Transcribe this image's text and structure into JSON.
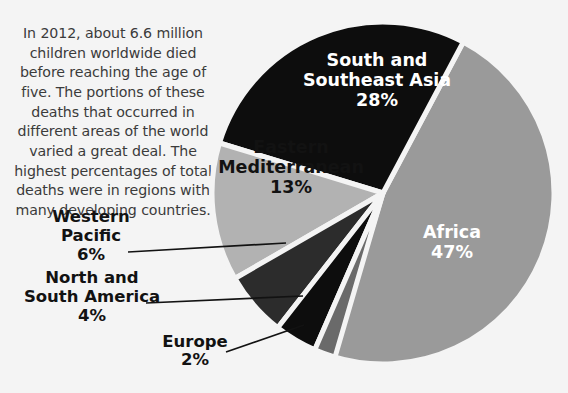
{
  "page": {
    "background_color": "#f4f4f4",
    "intro_paragraph": "In 2012, about 6.6 million children worldwide died before reaching the age of five. The portions of these deaths that occurred in different areas of the world varied a great deal. The highest percentages of total deaths were in regions with many developing countries."
  },
  "chart_data": {
    "type": "pie",
    "title": "",
    "subtitle": "",
    "xlabel": "",
    "ylabel": "",
    "units": "percent of total under-five deaths",
    "total_label": "6.6 million",
    "year": "2012",
    "legend_position": "none",
    "grid": false,
    "categories": [
      "Africa",
      "South and Southeast Asia",
      "Eastern Mediterranean",
      "Western Pacific",
      "North and South America",
      "Europe"
    ],
    "values": [
      47,
      28,
      13,
      6,
      4,
      2
    ],
    "slices": [
      {
        "name": "Africa",
        "label_line1": "Africa",
        "label_line2": "47%",
        "value": 47,
        "percent_text": "47%",
        "color": "#9a9a9a",
        "text_color": "#ffffff",
        "label_placement": "inside",
        "label_x": 452,
        "label_y": 243,
        "start_angle": -62,
        "end_angle": 107.2
      },
      {
        "name": "South and Southeast Asia",
        "label_line1": "South and",
        "label_line2": "Southeast Asia",
        "label_line3": "28%",
        "value": 28,
        "percent_text": "28%",
        "color": "#0d0d0d",
        "text_color": "#ffffff",
        "label_placement": "inside",
        "label_x": 377,
        "label_y": 81,
        "start_angle": -163,
        "end_angle": -62
      },
      {
        "name": "Eastern Mediterranean",
        "label_line1": "Eastern",
        "label_line2": "Mediterranean",
        "label_line3": "13%",
        "value": 13,
        "percent_text": "13%",
        "color": "#b2b2b2",
        "text_color": "#121212",
        "label_placement": "inside",
        "label_x": 291,
        "label_y": 168,
        "start_angle": -210,
        "end_angle": -163
      },
      {
        "name": "Western Pacific",
        "label_line1": "Western",
        "label_line2": "Pacific",
        "label_line3": "6%",
        "value": 6,
        "percent_text": "6%",
        "color": "#2c2c2c",
        "text_color": "#121212",
        "label_placement": "callout-left",
        "label_x": 91,
        "label_y": 241,
        "leader_from_x": 128,
        "leader_from_y": 252,
        "leader_to_x": 286,
        "leader_to_y": 243,
        "start_angle": -232,
        "end_angle": -210
      },
      {
        "name": "North and South America",
        "label_line1": "North and",
        "label_line2": "South America",
        "label_line3": "4%",
        "value": 4,
        "percent_text": "4%",
        "color": "#0d0d0d",
        "text_color": "#121212",
        "label_placement": "callout-left",
        "label_x": 92,
        "label_y": 302,
        "leader_from_x": 146,
        "leader_from_y": 303,
        "leader_to_x": 303,
        "leader_to_y": 296,
        "start_angle": -246.5,
        "end_angle": -232
      },
      {
        "name": "Europe",
        "label_line1": "Europe",
        "label_line2": "2%",
        "value": 2,
        "percent_text": "2%",
        "color": "#6a6a6a",
        "text_color": "#121212",
        "label_placement": "callout-left",
        "label_x": 195,
        "label_y": 356,
        "leader_from_x": 226,
        "leader_from_y": 352,
        "leader_to_x": 304,
        "leader_to_y": 325,
        "start_angle": -253.7,
        "end_angle": -246.5
      }
    ],
    "geometry": {
      "center_x": 383,
      "center_y": 193,
      "radius": 171,
      "gap_color": "#f4f4f4",
      "gap_width": 5
    }
  }
}
